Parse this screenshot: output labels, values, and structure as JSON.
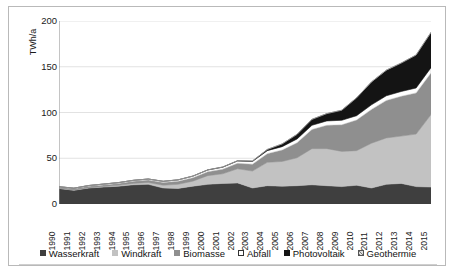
{
  "chart_data": {
    "type": "area",
    "stacked": true,
    "title": "",
    "xlabel": "",
    "ylabel": "TWh/a",
    "ylim": [
      0,
      200
    ],
    "yticks": [
      0,
      50,
      100,
      150,
      200
    ],
    "grid": true,
    "legend_position": "bottom",
    "categories": [
      "1990",
      "1991",
      "1992",
      "1993",
      "1994",
      "1995",
      "1996",
      "1997",
      "1998",
      "1999",
      "2000",
      "2001",
      "2002",
      "2003",
      "2004",
      "2005",
      "2006",
      "2007",
      "2008",
      "2009",
      "2010",
      "2011",
      "2012",
      "2013",
      "2014",
      "2015"
    ],
    "series": [
      {
        "name": "Wasserkraft",
        "color": "#3f3f3f",
        "values": [
          17.0,
          15.0,
          17.5,
          18.5,
          19.5,
          21.0,
          21.5,
          17.5,
          17.0,
          19.5,
          21.5,
          22.5,
          23.0,
          17.5,
          20.0,
          19.5,
          20.0,
          21.0,
          20.0,
          19.0,
          20.5,
          17.5,
          21.5,
          22.5,
          19.0,
          18.5
        ]
      },
      {
        "name": "Windkraft",
        "color": "#c2c2c2",
        "values": [
          0.1,
          0.2,
          0.3,
          0.6,
          0.9,
          1.5,
          2.0,
          3.0,
          4.5,
          5.5,
          9.5,
          10.5,
          15.5,
          18.5,
          25.5,
          27.0,
          30.5,
          39.5,
          40.5,
          38.5,
          37.8,
          48.9,
          50.7,
          51.7,
          57.4,
          79.2
        ]
      },
      {
        "name": "Biomasse",
        "color": "#8f8f8f",
        "values": [
          1.2,
          1.4,
          1.6,
          1.8,
          2.0,
          2.3,
          2.6,
          3.0,
          3.4,
          3.8,
          4.3,
          5.0,
          6.0,
          7.5,
          9.5,
          12.5,
          16.5,
          21.0,
          25.5,
          29.0,
          33.5,
          37.0,
          41.0,
          43.5,
          45.0,
          45.5
        ]
      },
      {
        "name": "Abfall",
        "color": "#ffffff",
        "values": [
          0.6,
          0.7,
          0.8,
          0.9,
          1.0,
          1.1,
          1.2,
          1.3,
          1.5,
          1.7,
          1.9,
          2.2,
          2.5,
          2.9,
          3.3,
          3.7,
          4.1,
          4.5,
          4.8,
          5.0,
          4.7,
          5.0,
          5.1,
          5.3,
          5.4,
          5.8
        ]
      },
      {
        "name": "Photovoltaik",
        "color": "#141414",
        "values": [
          0.0,
          0.0,
          0.0,
          0.0,
          0.0,
          0.0,
          0.0,
          0.0,
          0.0,
          0.0,
          0.1,
          0.2,
          0.3,
          0.6,
          1.3,
          3.0,
          5.0,
          6.5,
          8.0,
          11.0,
          19.5,
          25.0,
          28.0,
          31.0,
          36.0,
          38.5
        ]
      },
      {
        "name": "Geothermie",
        "color": "#a8a8a8",
        "values": [
          0.0,
          0.0,
          0.0,
          0.0,
          0.0,
          0.0,
          0.0,
          0.0,
          0.0,
          0.0,
          0.0,
          0.0,
          0.0,
          0.0,
          0.0,
          0.0,
          0.0,
          0.0,
          0.0,
          0.0,
          0.0,
          0.1,
          0.1,
          0.1,
          0.1,
          0.1
        ]
      }
    ],
    "totals": [
      18.9,
      17.3,
      20.2,
      21.8,
      23.4,
      25.9,
      27.3,
      24.8,
      26.4,
      30.5,
      37.3,
      40.4,
      47.3,
      47.0,
      59.6,
      65.7,
      76.1,
      92.5,
      98.8,
      102.5,
      116.0,
      133.5,
      146.4,
      154.1,
      162.9,
      187.6
    ]
  },
  "legend": {
    "items": [
      {
        "label": "Wasserkraft",
        "color": "#3f3f3f",
        "marker": "filled-square"
      },
      {
        "label": "Windkraft",
        "color": "#c2c2c2",
        "marker": "filled-square"
      },
      {
        "label": "Biomasse",
        "color": "#8f8f8f",
        "marker": "filled-square"
      },
      {
        "label": "Abfall",
        "color": "#ffffff",
        "marker": "open-square"
      },
      {
        "label": "Photovoltaik",
        "color": "#141414",
        "marker": "filled-square"
      },
      {
        "label": "Geothermie",
        "color": "#a8a8a8",
        "marker": "hatched-square"
      }
    ]
  }
}
